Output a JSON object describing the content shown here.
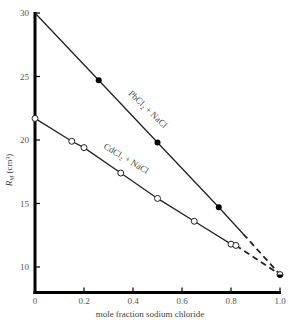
{
  "chart_data": {
    "type": "line",
    "title": "",
    "xlabel": "mole fraction sodium chloride",
    "ylabel": "R_M (cm³)",
    "ylabel_main": "R",
    "ylabel_sub": "M",
    "ylabel_unit": " (cm³)",
    "xlim": [
      0,
      1.0
    ],
    "ylim": [
      8,
      30
    ],
    "grid": false,
    "legend": "inline labels",
    "x_ticks": [
      0,
      0.2,
      0.4,
      0.6,
      0.8,
      1.0
    ],
    "x_tick_labels": [
      "0",
      "0.2",
      "0.4",
      "0.6",
      "0.8",
      "1.0"
    ],
    "y_ticks": [
      10,
      15,
      20,
      25,
      30
    ],
    "y_tick_labels": [
      "10",
      "15",
      "20",
      "25",
      "30"
    ],
    "series": [
      {
        "name": "PbCl₂ + NaCl",
        "marker": "filled-circle",
        "points": [
          {
            "x": 0.0,
            "y": 30.0
          },
          {
            "x": 0.26,
            "y": 24.7
          },
          {
            "x": 0.5,
            "y": 19.8
          },
          {
            "x": 0.75,
            "y": 14.7
          }
        ],
        "solid_to": {
          "x": 0.85,
          "y": 12.6
        },
        "dashed_to": {
          "x": 1.0,
          "y": 9.4
        }
      },
      {
        "name": "CdCl₂ + NaCl",
        "marker": "open-circle",
        "points": [
          {
            "x": 0.0,
            "y": 21.7
          },
          {
            "x": 0.15,
            "y": 19.9
          },
          {
            "x": 0.2,
            "y": 19.4
          },
          {
            "x": 0.35,
            "y": 17.4
          },
          {
            "x": 0.5,
            "y": 15.4
          },
          {
            "x": 0.65,
            "y": 13.6
          },
          {
            "x": 0.8,
            "y": 11.8
          },
          {
            "x": 0.82,
            "y": 11.7
          }
        ],
        "solid_to": {
          "x": 0.82,
          "y": 11.7
        },
        "dashed_to": {
          "x": 1.0,
          "y": 9.4
        }
      }
    ],
    "endpoint": {
      "x": 1.0,
      "y": 9.4,
      "marker": "half-filled-circle"
    },
    "annotations": [
      {
        "text": "PbCl₂ + NaCl",
        "near_series": 0
      },
      {
        "text": "CdCl₂ + NaCl",
        "near_series": 1
      }
    ]
  }
}
